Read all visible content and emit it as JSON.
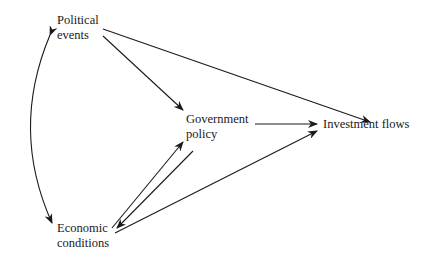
{
  "diagram": {
    "type": "path diagram",
    "nodes": {
      "political": {
        "line1": "Political",
        "line2": "events"
      },
      "government": {
        "line1": "Government",
        "line2": "policy"
      },
      "investment": {
        "label": "Investment flows"
      },
      "economic": {
        "line1": "Economic",
        "line2": "conditions"
      }
    },
    "edges": [
      {
        "from": "Political events",
        "to": "Investment flows"
      },
      {
        "from": "Political events",
        "to": "Government policy"
      },
      {
        "from": "Government policy",
        "to": "Investment flows"
      },
      {
        "from": "Economic conditions",
        "to": "Government policy"
      },
      {
        "from": "Government policy",
        "to": "Economic conditions"
      },
      {
        "from": "Economic conditions",
        "to": "Investment flows"
      },
      {
        "from": "Political events",
        "to": "Economic conditions",
        "bidirectional": true
      }
    ]
  }
}
